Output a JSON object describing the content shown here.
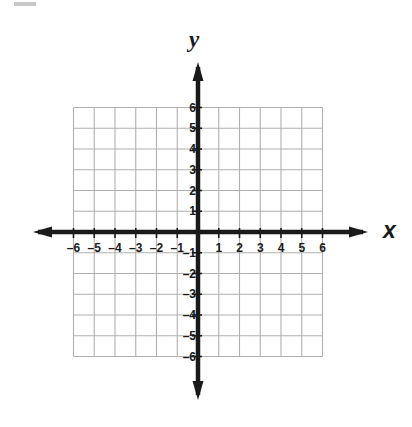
{
  "chart_data": {
    "type": "scatter",
    "title": "",
    "subtitle": "",
    "xlabel": "x",
    "ylabel": "y",
    "xlim": [
      -6,
      6
    ],
    "ylim": [
      -6,
      6
    ],
    "grid": true,
    "legend": null,
    "series": [],
    "x_tick_labels": [
      "–6",
      "–5",
      "–4",
      "–3",
      "–2",
      "–1",
      "1",
      "2",
      "3",
      "4",
      "5",
      "6"
    ],
    "x_tick_values": [
      -6,
      -5,
      -4,
      -3,
      -2,
      -1,
      1,
      2,
      3,
      4,
      5,
      6
    ],
    "y_tick_labels": [
      "6",
      "5",
      "4",
      "3",
      "2",
      "1",
      "–1",
      "–2",
      "–3",
      "–4",
      "–5",
      "–6"
    ],
    "y_tick_values": [
      6,
      5,
      4,
      3,
      2,
      1,
      -1,
      -2,
      -3,
      -4,
      -5,
      -6
    ],
    "origin_label": "",
    "annotations": [],
    "axis_color": "#1a1a1a",
    "grid_color": "#b0b0b0",
    "background_color": "#ffffff"
  },
  "figure": {
    "axis_name_x": "x",
    "axis_name_y": "y"
  }
}
